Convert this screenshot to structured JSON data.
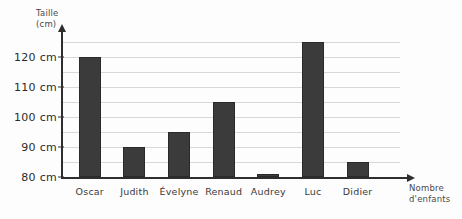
{
  "chart_data": {
    "type": "bar",
    "title": "",
    "subtitle": "",
    "categories": [
      "Oscar",
      "Judith",
      "Évelyne",
      "Renaud",
      "Audrey",
      "Luc",
      "Didier"
    ],
    "values": [
      120,
      90,
      95,
      105,
      81,
      125,
      85
    ],
    "unit": "cm",
    "xlabel": "Nombre\nd'enfants",
    "ylabel": "Taille\n(cm)",
    "ytick_labels": [
      "120 cm",
      "110 cm",
      "100 cm",
      "90 cm",
      "80 cm"
    ],
    "ytick_values": [
      120,
      110,
      100,
      90,
      80
    ],
    "ylim": [
      80,
      128
    ],
    "grid": true,
    "grid_step": 5,
    "gridline_values": [
      125,
      120,
      115,
      110,
      105,
      100,
      95,
      90,
      85,
      80
    ],
    "legend": null,
    "legend_position": "none",
    "series": [
      {
        "name": "Taille",
        "values": [
          120,
          90,
          95,
          105,
          81,
          125,
          85
        ]
      }
    ],
    "bar_color": "#3b3b3b",
    "axis_color": "#2e2e2e",
    "grid_color": "#d8d8d8"
  },
  "axes": {
    "y_title": "Taille\n(cm)",
    "x_title": "Nombre\nd'enfants"
  }
}
